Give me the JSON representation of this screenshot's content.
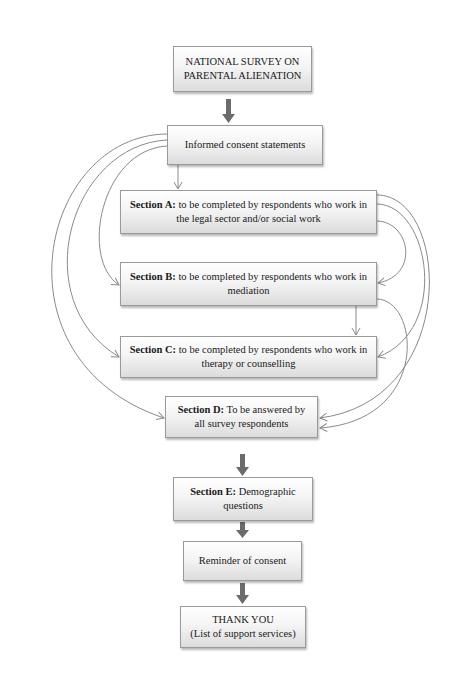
{
  "diagram": {
    "nodes": {
      "title": {
        "line1": "NATIONAL SURVEY ON",
        "line2": "PARENTAL ALIENATION"
      },
      "consent": {
        "label": "Informed consent statements"
      },
      "section_a": {
        "heading": "Section A:",
        "text": " to be completed by respondents who work in the legal sector and/or social work"
      },
      "section_b": {
        "heading": "Section B:",
        "text": " to be completed by respondents who work in mediation"
      },
      "section_c": {
        "heading": "Section C:",
        "text": " to be completed by respondents who work in therapy or counselling"
      },
      "section_d": {
        "heading": "Section D:",
        "text": " To be answered by all survey respondents"
      },
      "section_e": {
        "heading": "Section E:",
        "text": " Demographic questions"
      },
      "reminder": {
        "label": "Reminder of consent"
      },
      "thanks": {
        "line1": "THANK YOU",
        "line2": "(List of support services)"
      }
    },
    "edges": [
      {
        "from": "title",
        "to": "consent",
        "style": "thick-arrow"
      },
      {
        "from": "consent",
        "to": "section_a",
        "style": "thin-arrow"
      },
      {
        "from": "consent",
        "to": "section_b",
        "style": "curved-left"
      },
      {
        "from": "consent",
        "to": "section_c",
        "style": "curved-left"
      },
      {
        "from": "consent",
        "to": "section_d",
        "style": "curved-left"
      },
      {
        "from": "section_a",
        "to": "section_b",
        "style": "curved-right"
      },
      {
        "from": "section_a",
        "to": "section_c",
        "style": "curved-right"
      },
      {
        "from": "section_a",
        "to": "section_d",
        "style": "curved-right"
      },
      {
        "from": "section_b",
        "to": "section_c",
        "style": "thin-arrow"
      },
      {
        "from": "section_b",
        "to": "section_d",
        "style": "curved-right"
      },
      {
        "from": "section_d",
        "to": "section_e",
        "style": "thick-arrow"
      },
      {
        "from": "section_e",
        "to": "reminder",
        "style": "thick-arrow"
      },
      {
        "from": "reminder",
        "to": "thanks",
        "style": "thick-arrow"
      }
    ],
    "colors": {
      "line": "#8a8a8a",
      "thick_arrow": "#6b6b6b",
      "box_border": "#9a9a9a"
    }
  }
}
